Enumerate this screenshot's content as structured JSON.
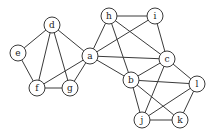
{
  "graph": {
    "nodes": [
      {
        "id": "d",
        "label": "d",
        "x": 52,
        "y": 25
      },
      {
        "id": "e",
        "label": "e",
        "x": 18,
        "y": 53
      },
      {
        "id": "f",
        "label": "f",
        "x": 37,
        "y": 88
      },
      {
        "id": "g",
        "label": "g",
        "x": 70,
        "y": 88
      },
      {
        "id": "a",
        "label": "a",
        "x": 90,
        "y": 56
      },
      {
        "id": "h",
        "label": "h",
        "x": 109,
        "y": 16
      },
      {
        "id": "i",
        "label": "i",
        "x": 155,
        "y": 16
      },
      {
        "id": "c",
        "label": "c",
        "x": 167,
        "y": 59
      },
      {
        "id": "b",
        "label": "b",
        "x": 131,
        "y": 80
      },
      {
        "id": "l",
        "label": "l",
        "x": 197,
        "y": 84
      },
      {
        "id": "j",
        "label": "j",
        "x": 142,
        "y": 120
      },
      {
        "id": "k",
        "label": "k",
        "x": 180,
        "y": 120
      }
    ],
    "edges": [
      [
        "d",
        "e"
      ],
      [
        "d",
        "f"
      ],
      [
        "d",
        "g"
      ],
      [
        "d",
        "a"
      ],
      [
        "e",
        "f"
      ],
      [
        "f",
        "g"
      ],
      [
        "f",
        "a"
      ],
      [
        "g",
        "a"
      ],
      [
        "a",
        "h"
      ],
      [
        "a",
        "i"
      ],
      [
        "a",
        "c"
      ],
      [
        "a",
        "b"
      ],
      [
        "h",
        "i"
      ],
      [
        "h",
        "c"
      ],
      [
        "h",
        "b"
      ],
      [
        "i",
        "c"
      ],
      [
        "c",
        "b"
      ],
      [
        "c",
        "l"
      ],
      [
        "c",
        "j"
      ],
      [
        "b",
        "l"
      ],
      [
        "b",
        "j"
      ],
      [
        "b",
        "k"
      ],
      [
        "l",
        "j"
      ],
      [
        "l",
        "k"
      ],
      [
        "j",
        "k"
      ]
    ],
    "node_radius": 8
  }
}
